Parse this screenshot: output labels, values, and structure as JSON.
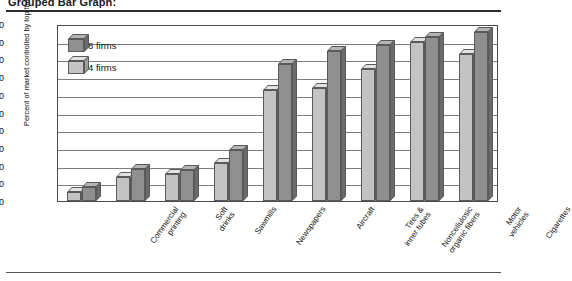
{
  "figure": {
    "caption": "Grouped Bar Graph:"
  },
  "chart_data": {
    "type": "bar",
    "title": "Grouped Bar Graph:",
    "xlabel": "",
    "ylabel": "Percent of market controlled by top firms",
    "ylim": [
      0,
      100
    ],
    "ytick_labels": [
      "0",
      "10",
      "20",
      "30",
      "40",
      "50",
      "60",
      "70",
      "80",
      "90",
      "100"
    ],
    "yticks": [
      0,
      10,
      20,
      30,
      40,
      50,
      60,
      70,
      80,
      90,
      100
    ],
    "grid": true,
    "legend_position": "top-left",
    "categories": [
      "Commercial\nprinting",
      "Soft\ndrinks",
      "Sawmills",
      "Newspapers",
      "Aircraft",
      "Tires &\ninner tubes",
      "Noncellulosic\norganic fibers",
      "Motor\nvehicles",
      "Cigarettes"
    ],
    "series": [
      {
        "name": "4 firms",
        "color": "#c3c3c3",
        "values": [
          5,
          14,
          16,
          22,
          65,
          66,
          77,
          93,
          86
        ]
      },
      {
        "name": "8 firms",
        "color": "#8f8f8f",
        "values": [
          8,
          19,
          18,
          30,
          80,
          88,
          91,
          96,
          99
        ]
      }
    ]
  },
  "legend": {
    "entries": [
      {
        "label": "8 firms",
        "swatch": "dark-cube-icon"
      },
      {
        "label": "4 firms",
        "swatch": "light-cube-icon"
      }
    ]
  }
}
